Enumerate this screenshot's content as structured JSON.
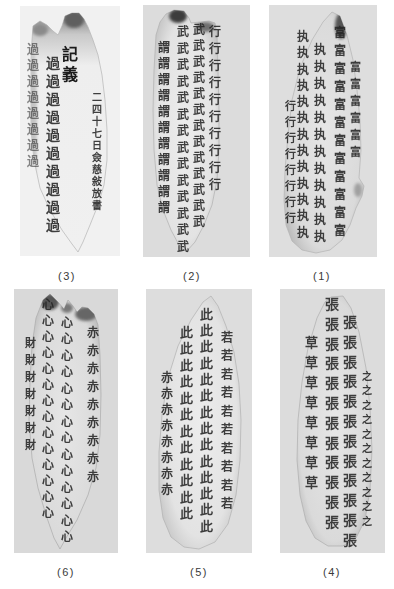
{
  "panels": [
    {
      "label": "(3)",
      "columns": [
        {
          "char": "過",
          "count": 8
        },
        {
          "char": "過",
          "count": 10
        },
        {
          "text": "記義"
        },
        {
          "text": "二四十七日僉慈敍放書"
        }
      ]
    },
    {
      "label": "(2)",
      "columns": [
        {
          "char": "謂",
          "count": 11
        },
        {
          "char": "武",
          "count": 14
        },
        {
          "char": "武",
          "count": 13
        },
        {
          "char": "行",
          "count": 10
        }
      ]
    },
    {
      "label": "(1)",
      "columns": [
        {
          "char": "行",
          "count": 8
        },
        {
          "char": "执",
          "count": 13
        },
        {
          "char": "执",
          "count": 12
        },
        {
          "char": "富",
          "count": 12
        },
        {
          "char": "富",
          "count": 6
        }
      ]
    },
    {
      "label": "(6)",
      "columns": [
        {
          "char": "財",
          "count": 7
        },
        {
          "char": "心",
          "count": 14
        },
        {
          "char": "心",
          "count": 14
        },
        {
          "char": "赤",
          "count": 9
        }
      ]
    },
    {
      "label": "(5)",
      "columns": [
        {
          "char": "赤",
          "count": 8
        },
        {
          "char": "此",
          "count": 12
        },
        {
          "char": "此",
          "count": 14
        },
        {
          "char": "若",
          "count": 10
        }
      ]
    },
    {
      "label": "(4)",
      "columns": [
        {
          "char": "草",
          "count": 8
        },
        {
          "char": "張",
          "count": 12
        },
        {
          "char": "張",
          "count": 12
        },
        {
          "char": "之",
          "count": 11
        }
      ]
    }
  ]
}
